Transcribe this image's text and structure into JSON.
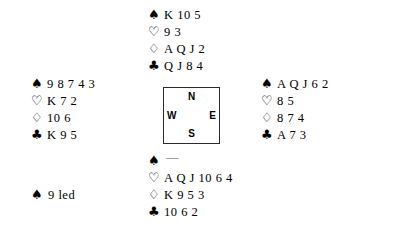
{
  "deal": {
    "north": {
      "position_label": "North",
      "suits": [
        {
          "suit": "spades",
          "symbol": "♠",
          "cards": "K 10 5"
        },
        {
          "suit": "hearts",
          "symbol": "♡",
          "cards": "9 3"
        },
        {
          "suit": "diamonds",
          "symbol": "♢",
          "cards": "A Q J 2"
        },
        {
          "suit": "clubs",
          "symbol": "♣",
          "cards": "Q J 8 4"
        }
      ]
    },
    "west": {
      "position_label": "West",
      "suits": [
        {
          "suit": "spades",
          "symbol": "♠",
          "cards": "9 8 7 4 3"
        },
        {
          "suit": "hearts",
          "symbol": "♡",
          "cards": "K 7 2"
        },
        {
          "suit": "diamonds",
          "symbol": "♢",
          "cards": "10 6"
        },
        {
          "suit": "clubs",
          "symbol": "♣",
          "cards": "K 9 5"
        }
      ]
    },
    "east": {
      "position_label": "East",
      "suits": [
        {
          "suit": "spades",
          "symbol": "♠",
          "cards": "A Q J 6 2"
        },
        {
          "suit": "hearts",
          "symbol": "♡",
          "cards": "8 5"
        },
        {
          "suit": "diamonds",
          "symbol": "♢",
          "cards": "8 7 4"
        },
        {
          "suit": "clubs",
          "symbol": "♣",
          "cards": "A 7 3"
        }
      ]
    },
    "south": {
      "position_label": "South",
      "suits": [
        {
          "suit": "spades",
          "symbol": "♠",
          "cards": "—"
        },
        {
          "suit": "hearts",
          "symbol": "♡",
          "cards": "A Q J 10 6 4"
        },
        {
          "suit": "diamonds",
          "symbol": "♢",
          "cards": "K 9 5 3"
        },
        {
          "suit": "clubs",
          "symbol": "♣",
          "cards": "10 6 2"
        }
      ]
    }
  },
  "compass": {
    "north": "N",
    "south": "S",
    "west": "W",
    "east": "E"
  },
  "lead": {
    "symbol": "♠",
    "text": "9 led"
  },
  "colors": {
    "ink": "#000000",
    "background": "#ffffff",
    "compass_border": "#2b2b2b",
    "void_dash": "#555555"
  }
}
